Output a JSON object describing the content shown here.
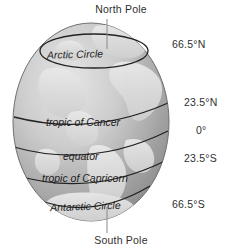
{
  "diagram": {
    "title_top": "North Pole",
    "title_bottom": "South Pole",
    "globe": {
      "fill_light": "#e2e2e2",
      "fill_mid": "#b3b3b3",
      "fill_dark": "#8e8e8e",
      "land_color": "#d8d8d8",
      "outline_color": "#4a4a4a"
    },
    "latitude_lines": [
      {
        "name": "arctic-circle",
        "label": "Arctic Circle",
        "degrees": "66.5°N"
      },
      {
        "name": "tropic-of-cancer",
        "label": "tropic of Cancer",
        "degrees": "23.5°N"
      },
      {
        "name": "equator",
        "label": "equator",
        "degrees": "0°"
      },
      {
        "name": "tropic-of-capricorn",
        "label": "tropic of Capricorn",
        "degrees": "23.5°S"
      },
      {
        "name": "antarctic-circle",
        "label": "Antarctic Circle",
        "degrees": "66.5°S"
      }
    ],
    "poles": {
      "north": "North Pole",
      "south": "South Pole"
    }
  }
}
